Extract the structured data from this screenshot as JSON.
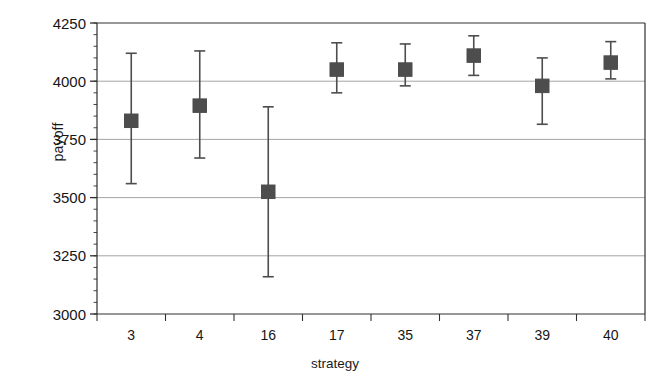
{
  "chart_data": {
    "type": "scatter",
    "title": "",
    "xlabel": "strategy",
    "ylabel": "payoff",
    "categories": [
      "3",
      "4",
      "16",
      "17",
      "35",
      "37",
      "39",
      "40"
    ],
    "values": [
      3830,
      3895,
      3525,
      4050,
      4050,
      4110,
      3980,
      4080
    ],
    "error_low": [
      3560,
      3670,
      3160,
      3950,
      3980,
      4025,
      3815,
      4010
    ],
    "error_high": [
      4120,
      4130,
      3890,
      4165,
      4160,
      4195,
      4100,
      4170
    ],
    "points": [
      {
        "category": "3",
        "value": 3830,
        "low": 3560,
        "high": 4120
      },
      {
        "category": "4",
        "value": 3895,
        "low": 3670,
        "high": 4130
      },
      {
        "category": "16",
        "value": 3525,
        "low": 3160,
        "high": 3890
      },
      {
        "category": "17",
        "value": 4050,
        "low": 3950,
        "high": 4165
      },
      {
        "category": "35",
        "value": 4050,
        "low": 3980,
        "high": 4160
      },
      {
        "category": "37",
        "value": 4110,
        "low": 4025,
        "high": 4195
      },
      {
        "category": "39",
        "value": 3980,
        "low": 3815,
        "high": 4100
      },
      {
        "category": "40",
        "value": 4080,
        "low": 4010,
        "high": 4170
      }
    ],
    "ylim": [
      3000,
      4250
    ],
    "yticks": [
      3000,
      3250,
      3500,
      3750,
      4000,
      4250
    ],
    "ytick_labels": [
      "3000",
      "3250",
      "3500",
      "3750",
      "4000",
      "4250"
    ],
    "minor_tick_interval": 50,
    "grid": true,
    "grid_axis": "y",
    "legend": null,
    "marker": "square",
    "marker_color": "#4d4d4d",
    "line_color": "#4d4d4d",
    "grid_color": "#9a9a9a",
    "axis_color": "#303030",
    "background": "#ffffff"
  },
  "axis": {
    "y_title": "payoff",
    "x_title": "strategy"
  }
}
